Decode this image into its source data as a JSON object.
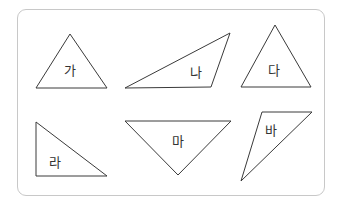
{
  "diagram": {
    "stroke_color": "#3a3a3a",
    "frame_border_color": "#c8c8c8",
    "triangles": [
      {
        "label": "가",
        "points": "70,34 36,88 107,88",
        "label_pos": [
          70,
          70
        ]
      },
      {
        "label": "나",
        "points": "125,88 230,33 211,87",
        "label_pos": [
          196,
          72
        ]
      },
      {
        "label": "다",
        "points": "275,25 241,87 311,87",
        "label_pos": [
          274,
          70
        ]
      },
      {
        "label": "라",
        "points": "36,122 36,176 107,176",
        "label_pos": [
          55,
          162
        ]
      },
      {
        "label": "마",
        "points": "125,121 231,121 178,175",
        "label_pos": [
          178,
          141
        ]
      },
      {
        "label": "바",
        "points": "262,112 312,112 241,181",
        "label_pos": [
          271,
          130
        ]
      }
    ]
  }
}
